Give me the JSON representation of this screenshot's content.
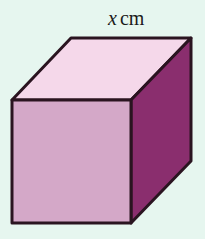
{
  "diagram": {
    "shape": "cube",
    "edge_label": {
      "variable": "x",
      "unit": "cm"
    },
    "colors": {
      "background": "#e6f6ef",
      "top_face": "#f5d8ea",
      "front_face": "#d4a8c8",
      "side_face": "#8a2e6e",
      "edge": "#2a1420"
    },
    "vertices": {
      "front_top_left": [
        12,
        100
      ],
      "front_top_right": [
        131,
        100
      ],
      "front_bottom_left": [
        12,
        223
      ],
      "front_bottom_right": [
        131,
        223
      ],
      "back_top_left": [
        71,
        38
      ],
      "back_top_right": [
        191,
        38
      ],
      "back_bottom_right": [
        191,
        161
      ]
    }
  }
}
